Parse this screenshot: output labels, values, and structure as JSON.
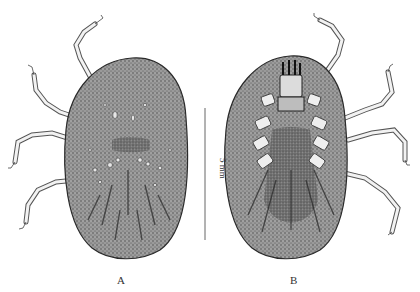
{
  "figure": {
    "panels": [
      {
        "label": "A",
        "view": "dorsal"
      },
      {
        "label": "B",
        "view": "ventral"
      }
    ],
    "scale_bar": {
      "label": "5 mm"
    }
  },
  "colors": {
    "body_fill": "#8a8a8a",
    "body_outline": "#2a2a2a",
    "leg_stroke": "#555555",
    "leg_fill": "#f2f2f2",
    "text": "#333333"
  }
}
